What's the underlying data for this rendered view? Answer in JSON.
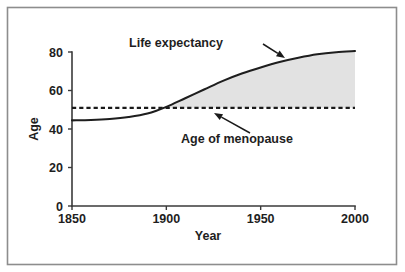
{
  "chart_data": {
    "type": "line",
    "title": "",
    "xlabel": "Year",
    "ylabel": "Age",
    "xlim": [
      1850,
      2000
    ],
    "ylim": [
      0,
      80
    ],
    "xticks": [
      1850,
      1900,
      1950,
      2000
    ],
    "yticks": [
      0,
      20,
      40,
      60,
      80
    ],
    "xtick_labels": [
      "1850",
      "1900",
      "1950",
      "2000"
    ],
    "ytick_labels": [
      "0",
      "20",
      "40",
      "60",
      "80"
    ],
    "grid": false,
    "legend": "none",
    "series": [
      {
        "name": "Life expectancy",
        "style": "solid",
        "x": [
          1850,
          1860,
          1870,
          1880,
          1890,
          1900,
          1910,
          1920,
          1930,
          1940,
          1950,
          1960,
          1970,
          1980,
          1990,
          2000
        ],
        "values": [
          44.5,
          44.7,
          45.2,
          46.2,
          48.0,
          51.5,
          56.0,
          60.5,
          65.0,
          68.8,
          72.0,
          74.8,
          77.0,
          78.8,
          79.9,
          80.5
        ]
      },
      {
        "name": "Age of menopause",
        "style": "dashed",
        "x": [
          1850,
          2000
        ],
        "values": [
          51.0,
          51.0
        ]
      }
    ],
    "shaded_region": {
      "label": "post-menopausal lifespan",
      "color": "#e2e2e2",
      "between": [
        "Life expectancy",
        "Age of menopause"
      ],
      "x_start": 1895,
      "x_end": 2000
    },
    "annotations": [
      {
        "name": "life-expectancy-annotation",
        "text": "Life expectancy",
        "text_x": 176,
        "text_y": 47,
        "arrow_from_x": 263,
        "arrow_from_y": 44,
        "arrow_to_x": 285,
        "arrow_to_y": 58
      },
      {
        "name": "menopause-annotation",
        "text": "Age of menopause",
        "text_x": 237,
        "text_y": 143,
        "arrow_from_x": 250,
        "arrow_from_y": 133,
        "arrow_to_x": 214,
        "arrow_to_y": 113
      }
    ]
  },
  "axes": {
    "y_title": "Age",
    "x_title": "Year"
  },
  "colors": {
    "frame": "#8d8d8d",
    "axis": "#3a3a3a",
    "curve": "#1e1e1e",
    "shade": "#e2e2e2",
    "text": "#1e1e1e"
  }
}
